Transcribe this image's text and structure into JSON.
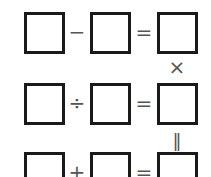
{
  "puzzle": {
    "rows": [
      {
        "operator": "−",
        "equals": "="
      },
      {
        "operator": "÷",
        "equals": "="
      },
      {
        "operator": "+",
        "equals": "="
      }
    ],
    "column_ops": [
      {
        "between_rows": "1-2",
        "symbol": "×"
      },
      {
        "between_rows": "2-3",
        "symbol": "‖"
      }
    ],
    "boxes": [
      {
        "row": 1,
        "col": 1,
        "value": ""
      },
      {
        "row": 1,
        "col": 2,
        "value": ""
      },
      {
        "row": 1,
        "col": 3,
        "value": ""
      },
      {
        "row": 2,
        "col": 1,
        "value": ""
      },
      {
        "row": 2,
        "col": 2,
        "value": ""
      },
      {
        "row": 2,
        "col": 3,
        "value": ""
      },
      {
        "row": 3,
        "col": 1,
        "value": ""
      },
      {
        "row": 3,
        "col": 2,
        "value": ""
      },
      {
        "row": 3,
        "col": 3,
        "value": ""
      }
    ]
  }
}
